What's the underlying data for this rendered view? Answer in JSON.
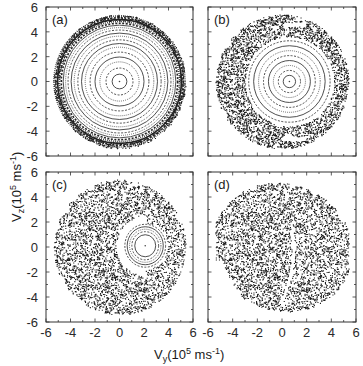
{
  "chart_data": [
    {
      "panel": "a",
      "type": "scatter",
      "title": "(a)",
      "xlabel": "Vy (10^5 ms^-1)",
      "ylabel": "Vz (10^5 ms^-1)",
      "xlim": [
        -6,
        6
      ],
      "ylim": [
        -6,
        6
      ],
      "xticks": [
        -6,
        -4,
        -2,
        0,
        2,
        4,
        6
      ],
      "yticks": [
        -6,
        -4,
        -2,
        0,
        2,
        4,
        6
      ],
      "description": "Concentric regular orbits (invariant circles) centered at (0,0) filling disk of radius ~5.4; dense outer band near r 4.8-5.4",
      "center": [
        0,
        0
      ],
      "boundary_radius": 5.4,
      "rings": [
        0.6,
        1.1,
        1.6,
        2.0,
        2.4,
        2.8,
        3.1,
        3.4,
        3.7,
        3.95,
        4.2,
        4.4,
        4.6,
        4.75,
        4.9,
        5.05,
        5.2,
        5.35
      ],
      "chaotic_fraction": 0.0
    },
    {
      "panel": "b",
      "type": "scatter",
      "title": "(b)",
      "xlim": [
        -6,
        6
      ],
      "ylim": [
        -6,
        6
      ],
      "xticks": [
        -6,
        -4,
        -2,
        0,
        2,
        4,
        6
      ],
      "yticks": [
        -6,
        -4,
        -2,
        0,
        2,
        4,
        6
      ],
      "description": "Chaotic sea in outer annulus (r ~3.5-5.4) with regular island of concentric rings centered near (0.5, 0); two small white islands near (1,4.6) and (1,-4.6)",
      "center": [
        0.6,
        0
      ],
      "boundary_radius": 5.4,
      "island_radius": 3.6,
      "rings": [
        0.5,
        0.9,
        1.3,
        1.7,
        2.1,
        2.5,
        2.9,
        3.3
      ],
      "chaotic_fraction": 0.65
    },
    {
      "panel": "c",
      "type": "scatter",
      "title": "(c)",
      "xlim": [
        -6,
        6
      ],
      "ylim": [
        -6,
        6
      ],
      "xticks": [
        -6,
        -4,
        -2,
        0,
        2,
        4,
        6
      ],
      "yticks": [
        -6,
        -4,
        -2,
        0,
        2,
        4,
        6
      ],
      "description": "Mostly chaotic disk (radius ~5.4) with a regular island centered near (2, 0), radius ~1.8",
      "center": [
        2.1,
        0.1
      ],
      "boundary_radius": 5.4,
      "island_radius": 1.9,
      "rings": [
        0.9,
        1.15,
        1.35,
        1.55,
        1.75
      ],
      "chaotic_fraction": 0.92
    },
    {
      "panel": "d",
      "type": "scatter",
      "title": "(d)",
      "xlim": [
        -6,
        6
      ],
      "ylim": [
        -6,
        6
      ],
      "xticks": [
        -6,
        -4,
        -2,
        0,
        2,
        4,
        6
      ],
      "yticks": [
        -6,
        -4,
        -2,
        0,
        2,
        4,
        6
      ],
      "description": "Fully chaotic, slightly distorted disk (radius ~5.4) with faint white arc structures near x~0-1",
      "center": [
        0,
        0
      ],
      "boundary_radius": 5.4,
      "rings": [],
      "chaotic_fraction": 1.0
    }
  ],
  "figure": {
    "xlabel_main": "V",
    "xlabel_sub": "y",
    "xlabel_rest": "(10",
    "xlabel_exp": "5",
    "xlabel_unit": " ms",
    "xlabel_unit_exp": "-1",
    "xlabel_close": ")",
    "ylabel_main": "V",
    "ylabel_sub": "z",
    "ylabel_rest": "(10",
    "ylabel_exp": "5",
    "ylabel_unit": " ms",
    "ylabel_unit_exp": "-1",
    "ylabel_close": ")",
    "panel_labels": [
      "(a)",
      "(b)",
      "(c)",
      "(d)"
    ],
    "tick_labels": [
      "-6",
      "-4",
      "-2",
      "0",
      "2",
      "4",
      "6"
    ],
    "colors": {
      "ink": "#1a1a1a",
      "frame": "#333333",
      "background": "#ffffff"
    }
  }
}
